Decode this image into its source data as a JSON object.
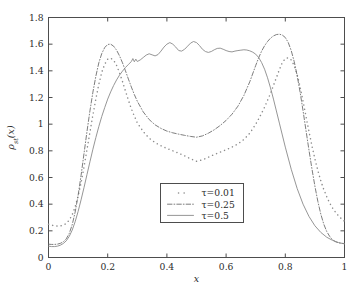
{
  "chart_data": {
    "type": "line",
    "title": "",
    "xlabel": "x",
    "ylabel": "ρst(x)",
    "ylabel_base": "ρ",
    "ylabel_sub": "st",
    "ylabel_arg": "(x)",
    "xlim": [
      0,
      1
    ],
    "ylim": [
      0,
      1.8
    ],
    "xticks": [
      0,
      0.2,
      0.4,
      0.6,
      0.8,
      1
    ],
    "xticklabels": [
      "0",
      "0.2",
      "0.4",
      "0.6",
      "0.8",
      "1"
    ],
    "yticks": [
      0,
      0.2,
      0.4,
      0.6,
      0.8,
      1.0,
      1.2,
      1.4,
      1.6,
      1.8
    ],
    "yticklabels": [
      "0",
      "0.2",
      "0.4",
      "0.6",
      "0.8",
      "1",
      "1.2",
      "1.4",
      "1.6",
      "1.8"
    ],
    "grid": false,
    "legend_position": "center-lower",
    "series": [
      {
        "name": "τ=0.01",
        "label": "τ=0.01",
        "style": "dotted",
        "color": "#8c8c8c",
        "x": [
          0.0,
          0.01,
          0.02,
          0.03,
          0.04,
          0.05,
          0.06,
          0.07,
          0.08,
          0.09,
          0.1,
          0.11,
          0.12,
          0.13,
          0.14,
          0.15,
          0.16,
          0.17,
          0.18,
          0.19,
          0.2,
          0.21,
          0.22,
          0.23,
          0.24,
          0.25,
          0.26,
          0.27,
          0.28,
          0.29,
          0.3,
          0.32,
          0.34,
          0.36,
          0.38,
          0.4,
          0.42,
          0.44,
          0.46,
          0.48,
          0.5,
          0.52,
          0.54,
          0.56,
          0.58,
          0.6,
          0.62,
          0.64,
          0.66,
          0.68,
          0.7,
          0.71,
          0.72,
          0.73,
          0.74,
          0.75,
          0.76,
          0.77,
          0.78,
          0.79,
          0.8,
          0.81,
          0.82,
          0.83,
          0.84,
          0.85,
          0.86,
          0.87,
          0.88,
          0.89,
          0.9,
          0.91,
          0.92,
          0.93,
          0.94,
          0.95,
          0.96,
          0.97,
          0.98,
          0.99,
          1.0
        ],
        "y": [
          0.25,
          0.243,
          0.238,
          0.235,
          0.236,
          0.242,
          0.255,
          0.28,
          0.32,
          0.38,
          0.46,
          0.56,
          0.68,
          0.81,
          0.94,
          1.07,
          1.19,
          1.3,
          1.39,
          1.45,
          1.487,
          1.495,
          1.48,
          1.44,
          1.385,
          1.32,
          1.25,
          1.18,
          1.115,
          1.06,
          1.01,
          0.945,
          0.895,
          0.862,
          0.838,
          0.818,
          0.8,
          0.782,
          0.762,
          0.74,
          0.722,
          0.732,
          0.752,
          0.772,
          0.79,
          0.808,
          0.828,
          0.852,
          0.885,
          0.932,
          1.0,
          1.04,
          1.082,
          1.128,
          1.178,
          1.232,
          1.29,
          1.35,
          1.41,
          1.462,
          1.492,
          1.498,
          1.482,
          1.44,
          1.372,
          1.28,
          1.172,
          1.058,
          0.945,
          0.838,
          0.74,
          0.652,
          0.575,
          0.51,
          0.455,
          0.408,
          0.37,
          0.338,
          0.312,
          0.29,
          0.272
        ]
      },
      {
        "name": "τ=0.25",
        "label": "τ=0.25",
        "style": "dashdot",
        "color": "#6e6e6e",
        "x": [
          0.0,
          0.01,
          0.02,
          0.03,
          0.04,
          0.05,
          0.06,
          0.07,
          0.08,
          0.09,
          0.1,
          0.11,
          0.12,
          0.13,
          0.14,
          0.15,
          0.16,
          0.17,
          0.18,
          0.19,
          0.2,
          0.21,
          0.22,
          0.23,
          0.24,
          0.25,
          0.26,
          0.27,
          0.28,
          0.29,
          0.3,
          0.32,
          0.34,
          0.36,
          0.38,
          0.4,
          0.42,
          0.44,
          0.46,
          0.48,
          0.5,
          0.52,
          0.54,
          0.56,
          0.58,
          0.6,
          0.62,
          0.64,
          0.66,
          0.68,
          0.7,
          0.71,
          0.72,
          0.73,
          0.74,
          0.75,
          0.76,
          0.77,
          0.78,
          0.79,
          0.8,
          0.81,
          0.82,
          0.83,
          0.84,
          0.85,
          0.86,
          0.87,
          0.88,
          0.89,
          0.9,
          0.91,
          0.92,
          0.93,
          0.94,
          0.95,
          0.96,
          0.97,
          0.98,
          0.99,
          1.0
        ],
        "y": [
          0.1,
          0.098,
          0.098,
          0.1,
          0.106,
          0.118,
          0.14,
          0.18,
          0.245,
          0.34,
          0.465,
          0.615,
          0.78,
          0.945,
          1.1,
          1.24,
          1.36,
          1.46,
          1.53,
          1.575,
          1.598,
          1.6,
          1.585,
          1.555,
          1.512,
          1.46,
          1.4,
          1.338,
          1.278,
          1.222,
          1.172,
          1.092,
          1.035,
          0.995,
          0.968,
          0.948,
          0.935,
          0.925,
          0.916,
          0.908,
          0.902,
          0.912,
          0.932,
          0.958,
          0.99,
          1.028,
          1.075,
          1.135,
          1.215,
          1.318,
          1.44,
          1.498,
          1.548,
          1.588,
          1.62,
          1.645,
          1.662,
          1.672,
          1.675,
          1.668,
          1.65,
          1.612,
          1.552,
          1.47,
          1.365,
          1.24,
          1.1,
          0.952,
          0.805,
          0.665,
          0.535,
          0.42,
          0.325,
          0.25,
          0.195,
          0.158,
          0.132,
          0.118,
          0.11,
          0.106,
          0.105
        ]
      },
      {
        "name": "τ=0.5",
        "label": "τ=0.5",
        "style": "solid",
        "color": "#8a8a8a",
        "x": [
          0.0,
          0.01,
          0.02,
          0.03,
          0.04,
          0.05,
          0.06,
          0.07,
          0.08,
          0.09,
          0.1,
          0.11,
          0.12,
          0.13,
          0.14,
          0.15,
          0.16,
          0.17,
          0.18,
          0.19,
          0.2,
          0.21,
          0.22,
          0.23,
          0.24,
          0.25,
          0.26,
          0.27,
          0.28,
          0.285,
          0.29,
          0.295,
          0.3,
          0.31,
          0.32,
          0.33,
          0.34,
          0.35,
          0.36,
          0.37,
          0.38,
          0.39,
          0.4,
          0.41,
          0.42,
          0.43,
          0.44,
          0.45,
          0.46,
          0.47,
          0.48,
          0.49,
          0.5,
          0.51,
          0.52,
          0.53,
          0.54,
          0.55,
          0.56,
          0.57,
          0.58,
          0.59,
          0.6,
          0.61,
          0.62,
          0.63,
          0.64,
          0.65,
          0.66,
          0.67,
          0.68,
          0.69,
          0.7,
          0.71,
          0.72,
          0.73,
          0.74,
          0.75,
          0.76,
          0.78,
          0.8,
          0.82,
          0.84,
          0.86,
          0.88,
          0.9,
          0.92,
          0.94,
          0.96,
          0.98,
          1.0
        ],
        "y": [
          0.085,
          0.082,
          0.082,
          0.085,
          0.092,
          0.105,
          0.125,
          0.158,
          0.205,
          0.268,
          0.345,
          0.432,
          0.525,
          0.622,
          0.718,
          0.812,
          0.9,
          0.982,
          1.058,
          1.125,
          1.188,
          1.242,
          1.29,
          1.332,
          1.368,
          1.398,
          1.425,
          1.448,
          1.47,
          1.492,
          1.468,
          1.488,
          1.47,
          1.482,
          1.5,
          1.518,
          1.528,
          1.52,
          1.512,
          1.522,
          1.548,
          1.578,
          1.6,
          1.612,
          1.6,
          1.578,
          1.552,
          1.548,
          1.562,
          1.585,
          1.608,
          1.62,
          1.612,
          1.59,
          1.562,
          1.545,
          1.538,
          1.545,
          1.558,
          1.568,
          1.57,
          1.562,
          1.552,
          1.545,
          1.542,
          1.548,
          1.552,
          1.555,
          1.558,
          1.556,
          1.55,
          1.54,
          1.525,
          1.5,
          1.462,
          1.412,
          1.348,
          1.272,
          1.188,
          1.008,
          0.828,
          0.662,
          0.518,
          0.4,
          0.308,
          0.238,
          0.188,
          0.152,
          0.128,
          0.112,
          0.102
        ]
      }
    ]
  },
  "legend": {
    "entries": [
      {
        "label": "τ=0.01",
        "style": "dotted"
      },
      {
        "label": "τ=0.25",
        "style": "dashdot"
      },
      {
        "label": "τ=0.5",
        "style": "solid"
      }
    ]
  },
  "colors": {
    "curve_dotted": "#8c8c8c",
    "curve_dashdot": "#6e6e6e",
    "curve_solid": "#8a8a8a",
    "axis": "#4d4d4d",
    "text": "#2b2b2b",
    "background": "#ffffff"
  }
}
